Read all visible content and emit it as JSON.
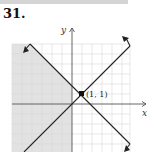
{
  "header": {
    "problem_number": "31."
  },
  "graph": {
    "x_axis_label": "x",
    "y_axis_label": "y",
    "point_label": "(1, 1)",
    "point": [
      1,
      1
    ],
    "lines": [
      {
        "name": "y = x",
        "direction": "increasing"
      },
      {
        "name": "y = -x + 2",
        "direction": "decreasing"
      }
    ],
    "shaded_region": "x <= 0 and x + y <= 2",
    "colors": {
      "shade": "#e2e2e2",
      "grid": "#d8d8d8",
      "axis": "#555555",
      "line": "#222222"
    }
  }
}
